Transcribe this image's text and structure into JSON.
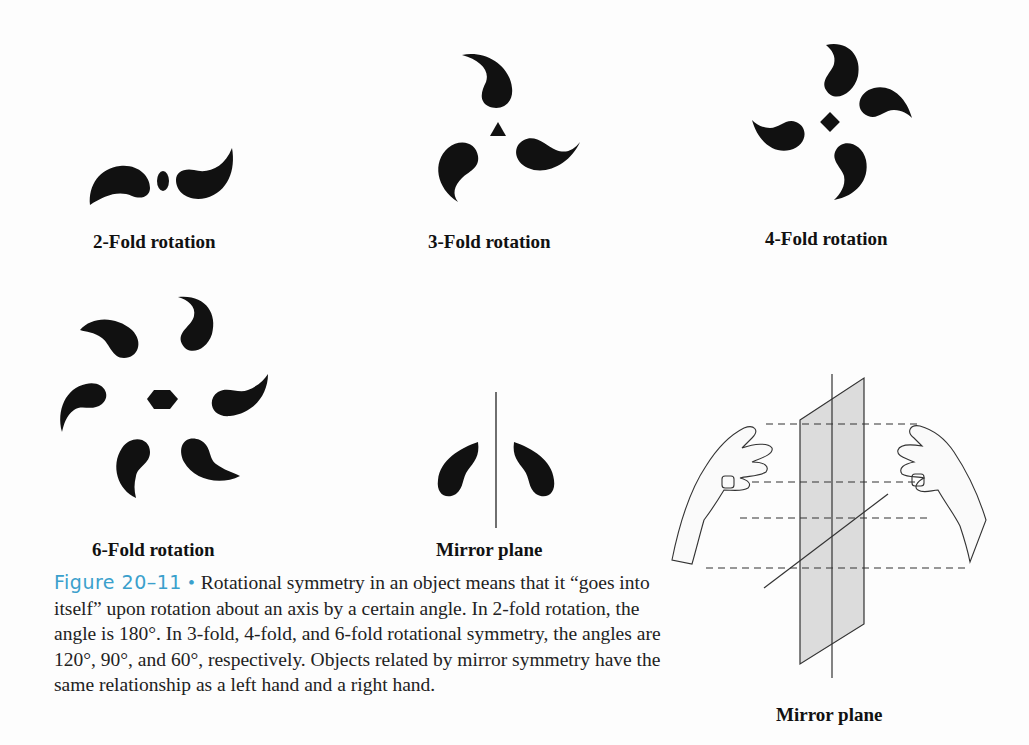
{
  "figure": {
    "panels": [
      {
        "id": "2-fold",
        "label": "2-Fold rotation",
        "center_symbol": "ellipse",
        "fold": 2,
        "angle_deg": 180
      },
      {
        "id": "3-fold",
        "label": "3-Fold rotation",
        "center_symbol": "triangle",
        "fold": 3,
        "angle_deg": 120
      },
      {
        "id": "4-fold",
        "label": "4-Fold rotation",
        "center_symbol": "square",
        "fold": 4,
        "angle_deg": 90
      },
      {
        "id": "6-fold",
        "label": "6-Fold rotation",
        "center_symbol": "hexagon",
        "fold": 6,
        "angle_deg": 60
      },
      {
        "id": "mirror",
        "label": "Mirror plane",
        "center_symbol": "line"
      },
      {
        "id": "hands",
        "label": "Mirror plane",
        "illustration": "left and right hands reflected across a plane"
      }
    ]
  },
  "caption": {
    "figure_number": "Figure 20–11",
    "bullet": "•",
    "text": "Rotational symmetry in an object means that it “goes into itself” upon rotation about an axis by a certain angle. In 2-fold rotation, the angle is 180°. In 3-fold, 4-fold, and 6-fold rotational symmetry, the angles are 120°, 90°, and 60°, respectively. Objects related by mirror symmetry have the same relationship as a left hand and a right hand."
  },
  "colors": {
    "ink": "#111111",
    "accent": "#3aa0cc",
    "plane_fill": "#d9d9d9"
  }
}
